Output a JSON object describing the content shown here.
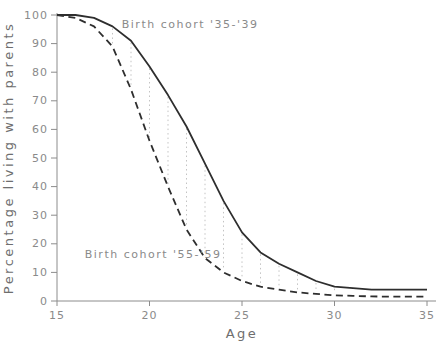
{
  "chart_data": {
    "type": "line",
    "title": "",
    "xlabel": "Age",
    "ylabel": "Percentage living with parents",
    "x_range": [
      15,
      35
    ],
    "y_range": [
      0,
      100
    ],
    "x_ticks": [
      15,
      20,
      25,
      30,
      35
    ],
    "y_ticks": [
      0,
      10,
      20,
      30,
      40,
      50,
      60,
      70,
      80,
      90,
      100
    ],
    "grid": "off",
    "legend_position": "inline-annotations",
    "x": [
      15,
      16,
      17,
      18,
      19,
      20,
      21,
      22,
      23,
      24,
      25,
      26,
      27,
      28,
      29,
      30,
      31,
      32,
      33,
      34,
      35
    ],
    "series": [
      {
        "name": "Birth cohort '35-'39",
        "style": "solid",
        "values": [
          100,
          100,
          99,
          96,
          91,
          82,
          72,
          61,
          48,
          35,
          24,
          17,
          13,
          10,
          7,
          5,
          4.5,
          4,
          4,
          4,
          4
        ]
      },
      {
        "name": "Birth cohort '55-'59",
        "style": "dashed",
        "values": [
          100,
          99,
          96,
          89,
          74,
          56,
          40,
          25,
          15,
          10,
          7,
          5,
          4,
          3,
          2.5,
          2,
          1.8,
          1.6,
          1.5,
          1.5,
          1.5
        ]
      }
    ],
    "hatch": {
      "description": "vertical dotted lines between the two curves at integer ages",
      "ages": [
        18,
        19,
        20,
        21,
        22,
        23,
        24,
        25,
        26,
        27,
        28,
        29,
        30
      ]
    },
    "annotations": [
      {
        "text": "Birth cohort '35-'39",
        "x_age": 18.5,
        "y_pct": 95.5,
        "anchor": "start"
      },
      {
        "text": "Birth cohort '55-'59",
        "x_age": 16.5,
        "y_pct": 15.0,
        "anchor": "start"
      }
    ],
    "colors": {
      "background": "#ffffff",
      "curve": "#2e2e2e",
      "axis": "#8c8c8c",
      "text": "#8a8a8a",
      "hatch": "#c3c3c3"
    }
  }
}
